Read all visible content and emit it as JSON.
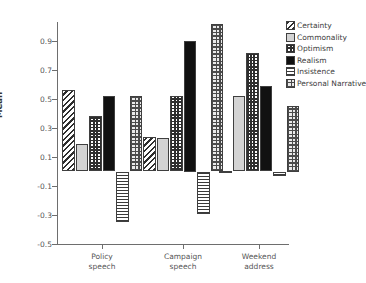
{
  "chart_data": {
    "type": "bar",
    "title": "",
    "xlabel": "",
    "ylabel": "Mean",
    "ylim": [
      -0.5,
      1.1
    ],
    "grid": false,
    "legend_position": "right",
    "categories": [
      "Policy speech",
      "Campaign speech",
      "Weekend address"
    ],
    "category_lines": [
      [
        "Policy",
        "speech"
      ],
      [
        "Campaign",
        "speech"
      ],
      [
        "Weekend",
        "address"
      ]
    ],
    "ytick_labels": [
      "0.9",
      "0.7",
      "0.5",
      "0.3",
      "0.1",
      "-0.1",
      "-0.3",
      "-0.5"
    ],
    "ytick_values": [
      0.9,
      0.7,
      0.5,
      0.3,
      0.1,
      -0.1,
      -0.3,
      -0.5
    ],
    "series": [
      {
        "name": "Certainty",
        "pattern": "diagonal-hatch",
        "values": [
          0.56,
          0.24,
          0.005
        ]
      },
      {
        "name": "Commonality",
        "pattern": "solid-light-gray",
        "values": [
          0.19,
          0.23,
          0.52
        ]
      },
      {
        "name": "Optimism",
        "pattern": "fine-checker",
        "values": [
          0.38,
          0.52,
          0.82
        ]
      },
      {
        "name": "Realism",
        "pattern": "solid-black",
        "values": [
          0.52,
          0.9,
          0.59
        ]
      },
      {
        "name": "Insistence",
        "pattern": "horizontal-lines",
        "values": [
          -0.35,
          -0.29,
          -0.03
        ]
      },
      {
        "name": "Personal Narrative",
        "pattern": "coarse-checker",
        "values": [
          0.52,
          1.02,
          0.45
        ]
      }
    ]
  },
  "axis": {
    "y_title": "Mean"
  },
  "legend": {
    "items": [
      {
        "label": "Certainty"
      },
      {
        "label": "Commonality"
      },
      {
        "label": "Optimism"
      },
      {
        "label": "Realism"
      },
      {
        "label": "Insistence"
      },
      {
        "label": "Personal Narrative"
      }
    ]
  },
  "colors": {
    "axis": "#6e6e6e",
    "text": "#3d3d3d",
    "bar_outline": "#3f3f3f",
    "realism_fill": "#111111",
    "commonality_fill": "#d3d3d3",
    "background": "#ffffff"
  }
}
